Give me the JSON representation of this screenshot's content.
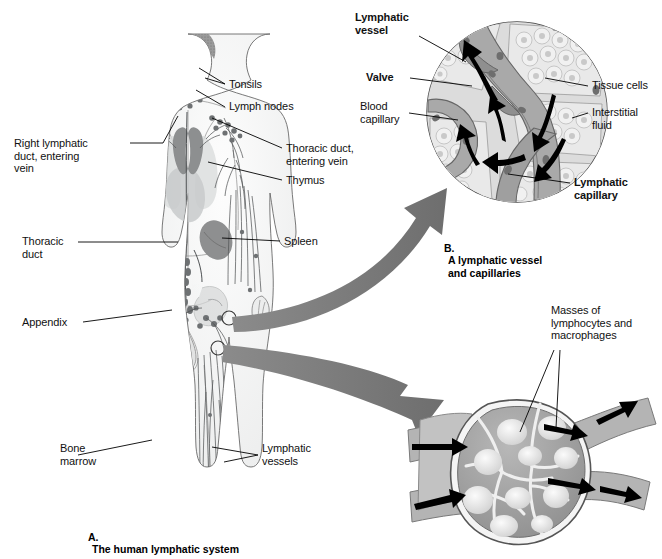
{
  "figure": {
    "title_panels": [
      "A",
      "B"
    ],
    "background": "#ffffff",
    "ink": "#111111",
    "arrow_color": "#7d7d7d"
  },
  "panel_a": {
    "caption_letter": "A.",
    "caption_text": "The human lymphatic system",
    "labels": {
      "tonsils": "Tonsils",
      "lymph_nodes": "Lymph nodes",
      "right_lymphatic_duct": "Right lymphatic\nduct, entering\nvein",
      "thoracic_duct_entering_vein": "Thoracic duct,\nentering vein",
      "thymus": "Thymus",
      "thoracic_duct": "Thoracic\nduct",
      "spleen": "Spleen",
      "appendix": "Appendix",
      "bone_marrow": "Bone\nmarrow",
      "lymphatic_vessels": "Lymphatic\nvessels"
    }
  },
  "panel_b": {
    "caption_letter": "B.",
    "caption_text": "A lymphatic vessel\nand capillaries",
    "labels": {
      "lymphatic_vessel": "Lymphatic\nvessel",
      "valve": "Valve",
      "blood_capillary": "Blood\ncapillary",
      "tissue_cells": "Tissue cells",
      "interstitial_fluid": "Interstitial\nfluid",
      "lymphatic_capillary": "Lymphatic\ncapillary"
    },
    "bold_labels": [
      "Lymphatic vessel",
      "Valve",
      "Lymphatic capillary"
    ]
  },
  "panel_c": {
    "labels": {
      "masses": "Masses of\nlymphocytes and\nmacrophages"
    }
  }
}
